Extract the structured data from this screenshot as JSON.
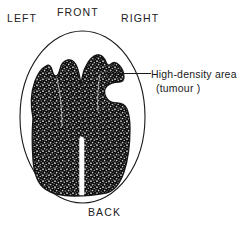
{
  "figure": {
    "type": "ct-brain-scan-diagram",
    "orientation_labels": {
      "left": "LEFT",
      "front": "FRONT",
      "right": "RIGHT",
      "back": "BACK"
    },
    "annotation": {
      "line1": "High-density area",
      "line2": "(tumour )",
      "leader_line": "horizontal-pointer"
    },
    "colors": {
      "ink": "#1a1a1a",
      "background": "#ffffff",
      "mass_fill": "#111111"
    },
    "elements": {
      "skull_outline": "skull-oval-outline",
      "mass": "high-density-mass",
      "midline_fissure": "midline-fissure"
    }
  }
}
